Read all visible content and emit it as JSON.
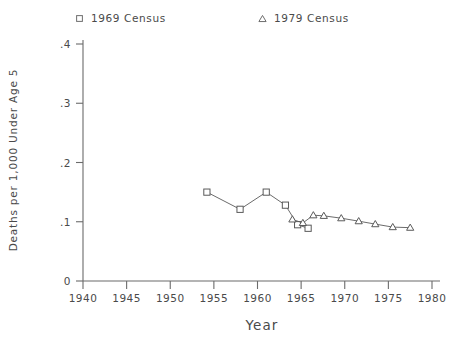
{
  "legend": {
    "entries": [
      {
        "label": "1969 Census",
        "marker": "square-marker"
      },
      {
        "label": "1979 Census",
        "marker": "triangle-marker"
      }
    ]
  },
  "chart_data": {
    "type": "line",
    "title": "",
    "xlabel": "Year",
    "ylabel": "Deaths per 1,000 Under Age 5",
    "xlim": [
      1940,
      1980
    ],
    "ylim": [
      0,
      0.4
    ],
    "xticks": [
      1940,
      1945,
      1950,
      1955,
      1960,
      1965,
      1970,
      1975,
      1980
    ],
    "xticklabels": [
      "1940",
      "1945",
      "1950",
      "1955",
      "1960",
      "1965",
      "1970",
      "1975",
      "1980"
    ],
    "yticks": [
      0,
      0.1,
      0.2,
      0.3,
      0.4
    ],
    "yticklabels": [
      "0",
      ".1",
      ".2",
      ".3",
      ".4"
    ],
    "grid": false,
    "legend_position": "top",
    "series": [
      {
        "name": "1969 Census",
        "marker": "square",
        "x": [
          1954.2,
          1958.0,
          1961.0,
          1963.2,
          1964.6,
          1965.8
        ],
        "y": [
          0.15,
          0.121,
          0.15,
          0.128,
          0.095,
          0.089
        ]
      },
      {
        "name": "1979 Census",
        "marker": "triangle",
        "x": [
          1964.0,
          1965.2,
          1966.4,
          1967.6,
          1969.6,
          1971.6,
          1973.5,
          1975.5,
          1977.5
        ],
        "y": [
          0.104,
          0.098,
          0.111,
          0.11,
          0.106,
          0.101,
          0.096,
          0.091,
          0.09
        ]
      }
    ]
  },
  "colors": {
    "axis": "#6b6b6b",
    "text": "#4a4a4a",
    "series_line": "#5a5a5a"
  }
}
